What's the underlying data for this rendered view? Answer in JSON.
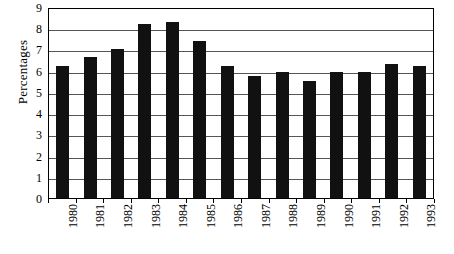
{
  "chart_data": {
    "type": "bar",
    "title": "",
    "xlabel": "",
    "ylabel": "Percentages",
    "ylim": [
      0,
      9
    ],
    "yticks": [
      0,
      1,
      2,
      3,
      4,
      5,
      6,
      7,
      8,
      9
    ],
    "ytick_labels": [
      "0",
      "1",
      "2",
      "3",
      "4",
      "5",
      "6",
      "7",
      "8",
      "9"
    ],
    "grid": true,
    "legend": "none",
    "bar_color": "#111111",
    "categories": [
      "1980",
      "1981",
      "1982",
      "1983",
      "1984",
      "1985",
      "1986",
      "1987",
      "1988",
      "1989",
      "1990",
      "1991",
      "1992",
      "1993"
    ],
    "values": [
      6.2,
      6.65,
      7.0,
      8.2,
      8.3,
      7.4,
      6.2,
      5.75,
      5.95,
      5.5,
      5.95,
      5.95,
      6.3,
      6.2
    ],
    "series": [
      {
        "name": "Percentages",
        "values": [
          6.2,
          6.65,
          7.0,
          8.2,
          8.3,
          7.4,
          6.2,
          5.75,
          5.95,
          5.5,
          5.95,
          5.95,
          6.3,
          6.2
        ]
      }
    ]
  }
}
